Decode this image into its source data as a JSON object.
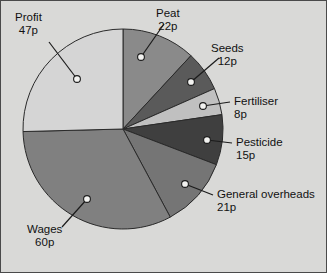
{
  "chart_data": {
    "type": "pie",
    "title": "",
    "subtitle": "",
    "xlabel": "",
    "ylabel": "",
    "unit": "p",
    "total": 185,
    "start_angle_deg": 0,
    "direction": "clockwise",
    "grid": false,
    "legend_position": "callout-labels",
    "categories": [
      "Peat",
      "Seeds",
      "Fertiliser",
      "Pesticide",
      "General overheads",
      "Wages",
      "Profit"
    ],
    "values": [
      22,
      12,
      8,
      15,
      21,
      60,
      47
    ],
    "labels": [
      "22p",
      "12p",
      "8p",
      "15p",
      "21p",
      "60p",
      "47p"
    ],
    "colors": [
      "#8a8a8a",
      "#5a5a5a",
      "#c0c0c0",
      "#3f3f3f",
      "#757575",
      "#808080",
      "#d5d5d5"
    ],
    "slices": [
      {
        "name": "Peat",
        "value": 22,
        "label": "22p",
        "color": "#8a8a8a"
      },
      {
        "name": "Seeds",
        "value": 12,
        "label": "12p",
        "color": "#5a5a5a"
      },
      {
        "name": "Fertiliser",
        "value": 8,
        "label": "8p",
        "color": "#c0c0c0"
      },
      {
        "name": "Pesticide",
        "value": 15,
        "label": "15p",
        "color": "#3f3f3f"
      },
      {
        "name": "General overheads",
        "value": 21,
        "label": "21p",
        "color": "#757575"
      },
      {
        "name": "Wages",
        "value": 60,
        "label": "60p",
        "color": "#808080"
      },
      {
        "name": "Profit",
        "value": 47,
        "label": "47p",
        "color": "#d5d5d5"
      }
    ]
  },
  "annotations": {
    "peat": {
      "name": "Peat",
      "value": "22p"
    },
    "seeds": {
      "name": "Seeds",
      "value": "12p"
    },
    "fertiliser": {
      "name": "Fertiliser",
      "value": "8p"
    },
    "pesticide": {
      "name": "Pesticide",
      "value": "15p"
    },
    "general_overheads": {
      "name": "General overheads",
      "value": "21p"
    },
    "wages": {
      "name": "Wages",
      "value": "60p"
    },
    "profit": {
      "name": "Profit",
      "value": "47p"
    }
  },
  "style": {
    "background": "#d9d9d7",
    "border": "#4a4a4a",
    "text": "#111111",
    "slice_outline": "#2a2a2a",
    "marker_fill": "#f2f2f0"
  }
}
